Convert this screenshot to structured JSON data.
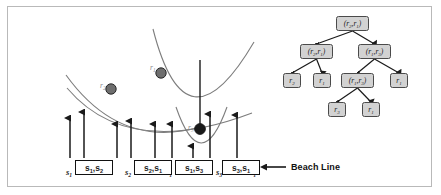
{
  "figure": {
    "frame_color": "#b9b9b9",
    "background": "#ffffff"
  },
  "beach_line_annotation": {
    "arrow": "left-arrow",
    "label": "Beach Line"
  },
  "sites": [
    {
      "id": "r2",
      "label": "r",
      "sub": "2",
      "cx": 111,
      "cy": 89,
      "r": 5.2,
      "fill": "#6e6e6e"
    },
    {
      "id": "r1",
      "label": "r",
      "sub": "1",
      "cx": 161,
      "cy": 73,
      "r": 5.2,
      "fill": "#6e6e6e"
    },
    {
      "id": "r3",
      "label": "r",
      "sub": "3",
      "cx": 200,
      "cy": 129,
      "r": 5.4,
      "fill": "#1a1a1a"
    }
  ],
  "site_labels": [
    {
      "text": "r",
      "sub": "2",
      "x": 100,
      "y": 82
    },
    {
      "text": "r",
      "sub": "1",
      "x": 150,
      "y": 64
    },
    {
      "text": "r",
      "sub": "3",
      "x": 188,
      "y": 124
    }
  ],
  "bottom_row": {
    "singles": [
      {
        "text": "s",
        "sub": "1",
        "x": 66,
        "y": 168
      },
      {
        "text": "s",
        "sub": "2",
        "x": 125,
        "y": 168
      },
      {
        "text": "s",
        "sub": "1",
        "x": 166,
        "y": 168
      },
      {
        "text": "s",
        "sub": "3",
        "x": 216,
        "y": 168
      },
      {
        "text": "s",
        "sub": "1",
        "x": 250,
        "y": 168
      }
    ],
    "pairs": [
      {
        "left": "s",
        "left_sub": "1",
        "right": "s",
        "right_sub": "2",
        "x": 75,
        "y": 160,
        "w": 38
      },
      {
        "left": "s",
        "left_sub": "2",
        "right": "s",
        "right_sub": "1",
        "x": 134,
        "y": 160,
        "w": 38
      },
      {
        "left": "s",
        "left_sub": "1",
        "right": "s",
        "right_sub": "3",
        "x": 175,
        "y": 160,
        "w": 38
      },
      {
        "left": "s",
        "left_sub": "3",
        "right": "s",
        "right_sub": "1",
        "x": 222,
        "y": 160,
        "w": 38
      }
    ]
  },
  "arrows_up": [
    {
      "x": 70,
      "y_top": 118,
      "y_bot": 158
    },
    {
      "x": 84,
      "y_top": 112,
      "y_bot": 158
    },
    {
      "x": 117,
      "y_top": 124,
      "y_bot": 158
    },
    {
      "x": 131,
      "y_top": 121,
      "y_bot": 158
    },
    {
      "x": 155,
      "y_top": 124,
      "y_bot": 158
    },
    {
      "x": 172,
      "y_top": 124,
      "y_bot": 158
    },
    {
      "x": 193,
      "y_top": 146,
      "y_bot": 158
    },
    {
      "x": 210,
      "y_top": 114,
      "y_bot": 158
    },
    {
      "x": 237,
      "y_top": 115,
      "y_bot": 158
    }
  ],
  "tree": {
    "root": {
      "text": "(r",
      "sub1": "2",
      "mid": ", r",
      "sub2": "1",
      "close": ")"
    },
    "nodes": [
      {
        "id": "n0",
        "type": "pair",
        "a": "r",
        "a_sub": "2",
        "b": "r",
        "b_sub": "1",
        "x": 336,
        "y": 16
      },
      {
        "id": "n1",
        "type": "pair",
        "a": "r",
        "a_sub": "2",
        "b": "r",
        "b_sub": "1",
        "x": 300,
        "y": 44
      },
      {
        "id": "n2",
        "type": "pair",
        "a": "r",
        "a_sub": "1",
        "b": "r",
        "b_sub": "3",
        "x": 358,
        "y": 44
      },
      {
        "id": "n3",
        "type": "leaf",
        "a": "r",
        "a_sub": "2",
        "x": 283,
        "y": 73
      },
      {
        "id": "n4",
        "type": "leaf",
        "a": "r",
        "a_sub": "1",
        "x": 313,
        "y": 73
      },
      {
        "id": "n5",
        "type": "pair",
        "a": "r",
        "a_sub": "1",
        "b": "r",
        "b_sub": "3",
        "x": 341,
        "y": 73
      },
      {
        "id": "n6",
        "type": "leaf",
        "a": "r",
        "a_sub": "1",
        "x": 390,
        "y": 73
      },
      {
        "id": "n7",
        "type": "leaf",
        "a": "r",
        "a_sub": "3",
        "x": 328,
        "y": 102
      },
      {
        "id": "n8",
        "type": "leaf",
        "a": "r",
        "a_sub": "1",
        "x": 362,
        "y": 102
      }
    ],
    "edges": [
      {
        "from": "n0",
        "to": "n1"
      },
      {
        "from": "n0",
        "to": "n2"
      },
      {
        "from": "n1",
        "to": "n3"
      },
      {
        "from": "n1",
        "to": "n4"
      },
      {
        "from": "n2",
        "to": "n5"
      },
      {
        "from": "n2",
        "to": "n6"
      },
      {
        "from": "n5",
        "to": "n7"
      },
      {
        "from": "n5",
        "to": "n8"
      }
    ],
    "node_fill": "#d2d2d2",
    "node_stroke": "#4a4a4a"
  },
  "parabolas": {
    "stroke": "#7d7d7d",
    "count": 3
  }
}
